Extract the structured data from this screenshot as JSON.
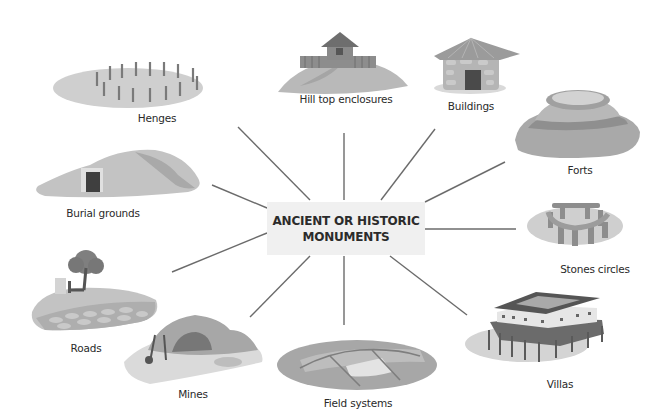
{
  "diagram": {
    "type": "mind-map",
    "center": {
      "line1": "ANCIENT OR HISTORIC",
      "line2": "MONUMENTS"
    },
    "colors": {
      "background": "#ffffff",
      "center_box": "#f0f0f0",
      "connector": "#6b6b6b",
      "text": "#2a2a2a"
    },
    "nodes": [
      {
        "id": "henges",
        "label": "Henges"
      },
      {
        "id": "hilltop",
        "label": "Hill top enclosures"
      },
      {
        "id": "buildings",
        "label": "Buildings"
      },
      {
        "id": "forts",
        "label": "Forts"
      },
      {
        "id": "stones",
        "label": "Stones circles"
      },
      {
        "id": "villas",
        "label": "Villas"
      },
      {
        "id": "field",
        "label": "Field systems"
      },
      {
        "id": "mines",
        "label": "Mines"
      },
      {
        "id": "roads",
        "label": "Roads"
      },
      {
        "id": "burial",
        "label": "Burial grounds"
      }
    ]
  }
}
